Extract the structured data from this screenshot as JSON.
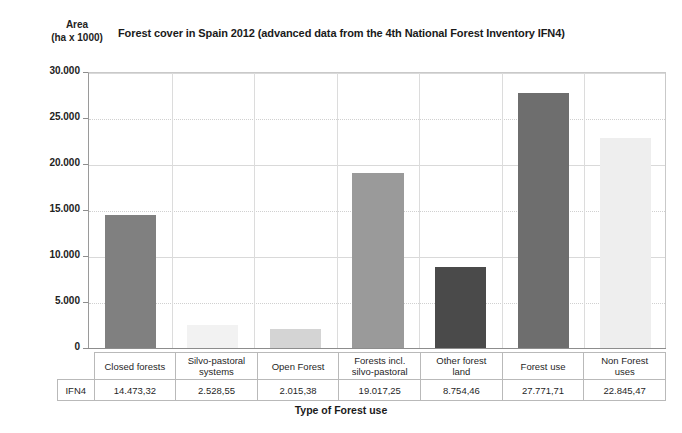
{
  "header": {
    "y_axis_label_line1": "Area",
    "y_axis_label_line2": "(ha x 1000)",
    "title": "Forest cover in Spain 2012 (advanced data from the 4th National Forest Inventory IFN4)",
    "x_axis_title": "Type of Forest use"
  },
  "table": {
    "corner_label": "",
    "row_label": "IFN4"
  },
  "chart_data": {
    "type": "bar",
    "title": "Forest cover in Spain 2012 (advanced data from the 4th National Forest Inventory IFN4)",
    "xlabel": "Type of Forest use",
    "ylabel": "Area (ha x 1000)",
    "ylim": [
      0,
      30000
    ],
    "yticks": [
      0,
      5000,
      10000,
      15000,
      20000,
      25000,
      30000
    ],
    "ytick_labels": [
      "0",
      "5.000",
      "10.000",
      "15.000",
      "20.000",
      "25.000",
      "30.000"
    ],
    "grid": true,
    "legend": "none",
    "series_name": "IFN4",
    "categories": [
      "Closed forests",
      "Silvo-pastoral systems",
      "Open Forest",
      "Forests incl. silvo-pastoral",
      "Other forest land",
      "Forest use",
      "Non Forest uses"
    ],
    "category_labels_line1": [
      "Closed forests",
      "Silvo-pastoral",
      "Open Forest",
      "Forests incl.",
      "Other forest",
      "Forest use",
      "Non Forest"
    ],
    "category_labels_line2": [
      "",
      "systems",
      "",
      "silvo-pastoral",
      "land",
      "",
      "uses"
    ],
    "values": [
      14473.32,
      2528.55,
      2015.38,
      19017.25,
      8754.46,
      27771.71,
      22845.47
    ],
    "value_labels": [
      "14.473,32",
      "2.528,55",
      "2.015,38",
      "19.017,25",
      "8.754,46",
      "27.771,71",
      "22.845,47"
    ],
    "bar_colors": [
      "#808080",
      "#f2f2f2",
      "#d4d4d4",
      "#9a9a9a",
      "#4a4a4a",
      "#6e6e6e",
      "#eeeeee"
    ]
  }
}
